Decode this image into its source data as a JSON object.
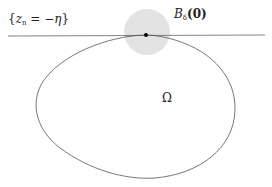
{
  "diagram": {
    "plane_label": {
      "open": "{",
      "var": "z",
      "sub": "n",
      "eq": " = −",
      "greek": "η",
      "close": "}"
    },
    "ball_label": {
      "letter": "B",
      "sub": "δ",
      "arg": "(0)"
    },
    "domain_label": "Ω",
    "colors": {
      "ball_fill": "#e3e3e3",
      "line": "#555555",
      "curve": "#555555",
      "point": "#000000"
    }
  }
}
